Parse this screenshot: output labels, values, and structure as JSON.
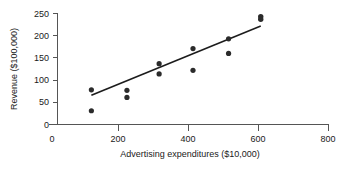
{
  "chart_data": {
    "type": "scatter",
    "title": "",
    "xlabel": "Advertising expenditures ($10,000)",
    "ylabel": "Revenue ($100,000)",
    "xlim": [
      0,
      800
    ],
    "ylim": [
      0,
      250
    ],
    "grid": false,
    "legend": null,
    "x_ticks_major": [
      0,
      200,
      400,
      600,
      800
    ],
    "x_ticks_minor": [
      100,
      300,
      500,
      700
    ],
    "x_tick_labels": [
      "0",
      "200",
      "400",
      "600",
      "800"
    ],
    "y_ticks_major": [
      0,
      50,
      100,
      150,
      200,
      250
    ],
    "y_tick_labels": [
      "0",
      "50",
      "100",
      "150",
      "200",
      "250"
    ],
    "points": [
      {
        "x": 100,
        "y": 78
      },
      {
        "x": 100,
        "y": 31
      },
      {
        "x": 205,
        "y": 77
      },
      {
        "x": 205,
        "y": 61
      },
      {
        "x": 300,
        "y": 137
      },
      {
        "x": 300,
        "y": 114
      },
      {
        "x": 400,
        "y": 171
      },
      {
        "x": 400,
        "y": 122
      },
      {
        "x": 505,
        "y": 193
      },
      {
        "x": 505,
        "y": 160
      },
      {
        "x": 600,
        "y": 243
      },
      {
        "x": 600,
        "y": 237
      }
    ],
    "trendline": {
      "label": "regression-line",
      "x_start": 100,
      "y_start": 66,
      "x_end": 600,
      "y_end": 222
    },
    "marker_color": "#2b2b2b",
    "line_color": "#1c1c1c",
    "axis_color": "#555555",
    "background_color": "#ffffff"
  }
}
